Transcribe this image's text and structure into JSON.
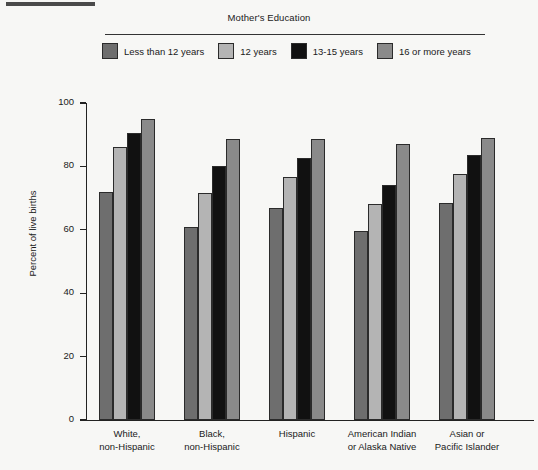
{
  "figure": {
    "legend_title": "Mother's Education",
    "y_axis_title": "Percent of live births"
  },
  "chart_data": {
    "type": "bar",
    "title": "Mother's Education",
    "xlabel": "",
    "ylabel": "Percent of live births",
    "ylim": [
      0,
      100
    ],
    "yticks": [
      0,
      20,
      40,
      60,
      80,
      100
    ],
    "grid": false,
    "legend_position": "top",
    "categories": [
      "White,\nnon-Hispanic",
      "Black,\nnon-Hispanic",
      "Hispanic",
      "American Indian\nor Alaska Native",
      "Asian or\nPacific Islander"
    ],
    "category_lines": [
      [
        "White,",
        "non-Hispanic"
      ],
      [
        "Black,",
        "non-Hispanic"
      ],
      [
        "Hispanic",
        ""
      ],
      [
        "American Indian",
        "or Alaska Native"
      ],
      [
        "Asian or",
        "Pacific Islander"
      ]
    ],
    "series": [
      {
        "name": "Less than 12 years",
        "color": "#6e6e6e",
        "values": [
          72,
          61,
          67,
          59.5,
          68.5
        ]
      },
      {
        "name": "12 years",
        "color": "#b4b4b4",
        "values": [
          86,
          71.5,
          76.5,
          68,
          77.5
        ]
      },
      {
        "name": "13-15 years",
        "color": "#111111",
        "values": [
          90.5,
          80,
          82.5,
          74,
          83.5
        ]
      },
      {
        "name": "16 or more years",
        "color": "#8a8a8a",
        "values": [
          95,
          88.5,
          88.5,
          87,
          89
        ]
      }
    ]
  },
  "legend": {
    "items": [
      {
        "label": "Less than 12 years",
        "color": "#6e6e6e"
      },
      {
        "label": "12 years",
        "color": "#b4b4b4"
      },
      {
        "label": "13-15 years",
        "color": "#111111"
      },
      {
        "label": "16 or more years",
        "color": "#8a8a8a"
      }
    ]
  }
}
